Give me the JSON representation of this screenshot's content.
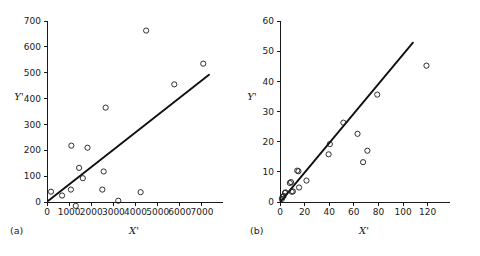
{
  "figure": {
    "background_color": "#ffffff",
    "ink_color": "#1a1a1a",
    "panels": [
      "a",
      "b"
    ]
  },
  "chart_data": [
    {
      "type": "scatter",
      "panel_label": "(a)",
      "title": "",
      "xlabel": "X'",
      "ylabel": "Y'",
      "xlim": [
        0,
        7500
      ],
      "ylim": [
        -30,
        700
      ],
      "xticks": [
        0,
        1000,
        2000,
        3000,
        4000,
        5000,
        6000,
        7000
      ],
      "xtick_labels": [
        "0",
        "1000",
        "2000",
        "3000",
        "4000",
        "5000",
        "6000",
        "7000"
      ],
      "yticks": [
        0,
        100,
        200,
        300,
        400,
        500,
        600,
        700
      ],
      "ytick_labels": [
        "0",
        "100",
        "200",
        "300",
        "400",
        "500",
        "600",
        "700"
      ],
      "grid": false,
      "legend": false,
      "marker": "open-circle",
      "points": [
        {
          "x": 180,
          "y": 40
        },
        {
          "x": 680,
          "y": 25
        },
        {
          "x": 1080,
          "y": 48
        },
        {
          "x": 1100,
          "y": 218
        },
        {
          "x": 1300,
          "y": -15
        },
        {
          "x": 1450,
          "y": 132
        },
        {
          "x": 1620,
          "y": 92
        },
        {
          "x": 1830,
          "y": 210
        },
        {
          "x": 2500,
          "y": 48
        },
        {
          "x": 2560,
          "y": 118
        },
        {
          "x": 2650,
          "y": 365
        },
        {
          "x": 3220,
          "y": 5
        },
        {
          "x": 4230,
          "y": 38
        },
        {
          "x": 4480,
          "y": 663
        },
        {
          "x": 5750,
          "y": 455
        },
        {
          "x": 7060,
          "y": 535
        }
      ],
      "fit_line": {
        "x_start": 60,
        "y_start": 5,
        "x_end": 7320,
        "y_end": 492
      }
    },
    {
      "type": "scatter",
      "panel_label": "(b)",
      "title": "",
      "xlabel": "X'",
      "ylabel": "Y'",
      "xlim": [
        0,
        130
      ],
      "ylim": [
        0,
        60
      ],
      "xticks": [
        0,
        20,
        40,
        60,
        80,
        100,
        120
      ],
      "xtick_labels": [
        "0",
        "20",
        "40",
        "60",
        "80",
        "100",
        "120"
      ],
      "yticks": [
        0,
        10,
        20,
        30,
        40,
        50,
        60
      ],
      "ytick_labels": [
        "0",
        "10",
        "20",
        "30",
        "40",
        "50",
        "60"
      ],
      "grid": false,
      "legend": false,
      "marker": "open-circle",
      "points": [
        {
          "x": 1.5,
          "y": 1.0
        },
        {
          "x": 2.0,
          "y": 1.6
        },
        {
          "x": 3.0,
          "y": 2.0
        },
        {
          "x": 4.0,
          "y": 3.0
        },
        {
          "x": 4.5,
          "y": 3.2
        },
        {
          "x": 8.0,
          "y": 6.3
        },
        {
          "x": 9.0,
          "y": 6.6
        },
        {
          "x": 9.5,
          "y": 3.4
        },
        {
          "x": 10.5,
          "y": 3.5
        },
        {
          "x": 14.0,
          "y": 10.4
        },
        {
          "x": 15.0,
          "y": 10.2
        },
        {
          "x": 15.5,
          "y": 4.8
        },
        {
          "x": 21.5,
          "y": 7.1
        },
        {
          "x": 39.5,
          "y": 15.8
        },
        {
          "x": 40.5,
          "y": 19.2
        },
        {
          "x": 51.5,
          "y": 26.3
        },
        {
          "x": 63.0,
          "y": 22.6
        },
        {
          "x": 67.5,
          "y": 13.2
        },
        {
          "x": 71.0,
          "y": 17.0
        },
        {
          "x": 79.0,
          "y": 35.6
        },
        {
          "x": 119.0,
          "y": 45.2
        }
      ],
      "fit_line": {
        "x_start": 0.5,
        "y_start": 0.2,
        "x_end": 108.0,
        "y_end": 52.8
      }
    }
  ]
}
